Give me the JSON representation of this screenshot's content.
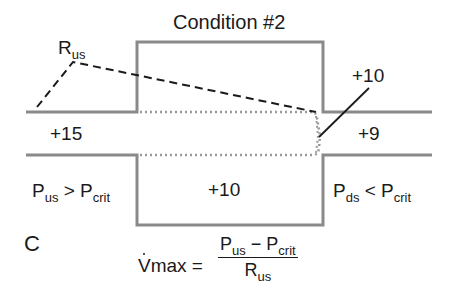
{
  "title": "Condition #2",
  "panel_letter": "C",
  "colors": {
    "vessel_wall": "#8a8a8a",
    "collapsed_wall": "#9a9a9a",
    "text": "#1a1a1a",
    "pressure_line": "#1a1a1a"
  },
  "labels": {
    "resistance": {
      "base": "R",
      "sub": "us"
    },
    "upstream_pressure": "+15",
    "collapse_pressure": "+10",
    "chamber_pressure": "+10",
    "downstream_pressure": "+9",
    "upstream_condition": {
      "p1": "P",
      "p1_sub": "us",
      "op": ">",
      "p2": "P",
      "p2_sub": "crit"
    },
    "downstream_condition": {
      "p1": "P",
      "p1_sub": "ds",
      "op": "<",
      "p2": "P",
      "p2_sub": "crit"
    }
  },
  "equation": {
    "lhs": "Vmax",
    "equals": "=",
    "numerator": {
      "a": "P",
      "a_sub": "us",
      "minus": "−",
      "b": "P",
      "b_sub": "crit"
    },
    "denominator": {
      "base": "R",
      "sub": "us"
    }
  }
}
